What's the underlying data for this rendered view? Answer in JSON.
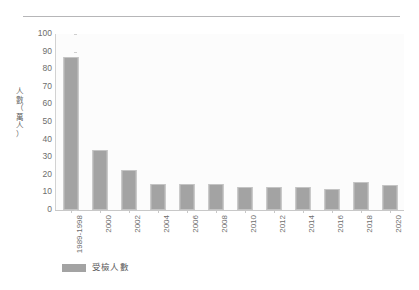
{
  "chart_data": {
    "type": "bar",
    "title": "",
    "xlabel": "",
    "ylabel": "人數（萬人）",
    "ylim": [
      0,
      100
    ],
    "ytick_step": 10,
    "grid": false,
    "legend_position": "bottom-left",
    "bar_color": "#a3a3a3",
    "categories": [
      "1989-1998",
      "2000",
      "2002",
      "2004",
      "2006",
      "2008",
      "2010",
      "2012",
      "2014",
      "2016",
      "2018",
      "2020"
    ],
    "series": [
      {
        "name": "受檢人數",
        "values": [
          87,
          34,
          23,
          15,
          15,
          15,
          13,
          13,
          13,
          12,
          16,
          14
        ]
      }
    ],
    "yticks": [
      "100",
      "90",
      "80",
      "70",
      "60",
      "50",
      "40",
      "30",
      "20",
      "10",
      "0"
    ],
    "ytick_values": [
      100,
      90,
      80,
      70,
      60,
      50,
      40,
      30,
      20,
      10,
      0
    ]
  },
  "axis": {
    "y_title_chars": [
      "人",
      "數",
      "（",
      "萬",
      "人",
      "）"
    ]
  },
  "legend": {
    "entries": [
      {
        "label": "受檢人數",
        "color": "#a3a3a3"
      }
    ]
  },
  "colors": {
    "bar": "#a3a3a3",
    "bar_edge": "#c4c4c4",
    "axis": "#c8c8c8",
    "rule": "#b6b6b8",
    "text": "#6d6d6d"
  }
}
